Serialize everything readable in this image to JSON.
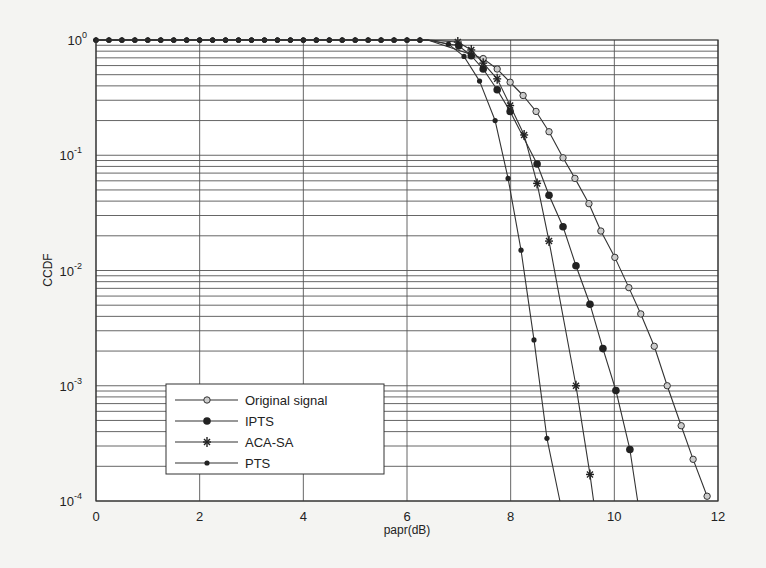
{
  "chart_data": {
    "type": "line",
    "title": "",
    "xlabel": "papr(dB)",
    "ylabel": "CCDF",
    "xlim": [
      0,
      12
    ],
    "ylim": [
      0.0001,
      1
    ],
    "yscale": "log",
    "grid": true,
    "x_ticks": [
      "0",
      "2",
      "4",
      "6",
      "8",
      "10",
      "12"
    ],
    "y_ticks": [
      {
        "base": "10",
        "exp": "0"
      },
      {
        "base": "10",
        "exp": "-1"
      },
      {
        "base": "10",
        "exp": "-2"
      },
      {
        "base": "10",
        "exp": "-3"
      },
      {
        "base": "10",
        "exp": "-4"
      }
    ],
    "legend_position": "lower left",
    "series": [
      {
        "name": "Original signal",
        "marker": "open-circle",
        "points": [
          [
            0,
            1
          ],
          [
            6.4,
            1
          ],
          [
            7.47,
            0.69
          ],
          [
            7.74,
            0.56
          ],
          [
            7.99,
            0.43
          ],
          [
            8.24,
            0.33
          ],
          [
            8.49,
            0.24
          ],
          [
            8.74,
            0.16
          ],
          [
            9.01,
            0.095
          ],
          [
            9.24,
            0.063
          ],
          [
            9.51,
            0.038
          ],
          [
            9.74,
            0.022
          ],
          [
            10.01,
            0.013
          ],
          [
            10.28,
            0.0071
          ],
          [
            10.51,
            0.0042
          ],
          [
            10.77,
            0.0022
          ],
          [
            11.02,
            0.001
          ],
          [
            11.29,
            0.00045
          ],
          [
            11.52,
            0.00023
          ],
          [
            11.79,
            0.00011
          ]
        ]
      },
      {
        "name": "IPTS",
        "marker": "filled-circle",
        "points": [
          [
            0,
            1
          ],
          [
            6.4,
            1
          ],
          [
            7.0,
            0.89
          ],
          [
            7.24,
            0.73
          ],
          [
            7.47,
            0.56
          ],
          [
            7.74,
            0.37
          ],
          [
            7.99,
            0.24
          ],
          [
            8.51,
            0.084
          ],
          [
            8.74,
            0.045
          ],
          [
            9.01,
            0.024
          ],
          [
            9.26,
            0.011
          ],
          [
            9.53,
            0.0051
          ],
          [
            9.78,
            0.0021
          ],
          [
            10.03,
            0.00091
          ],
          [
            10.3,
            0.00028
          ],
          [
            10.45,
            0.0001
          ]
        ]
      },
      {
        "name": "ACA-SA",
        "marker": "star",
        "points": [
          [
            0,
            1
          ],
          [
            6.4,
            1
          ],
          [
            6.98,
            0.96
          ],
          [
            7.24,
            0.82
          ],
          [
            7.47,
            0.63
          ],
          [
            7.74,
            0.46
          ],
          [
            7.99,
            0.27
          ],
          [
            8.26,
            0.15
          ],
          [
            8.51,
            0.057
          ],
          [
            8.74,
            0.018
          ],
          [
            9.26,
            0.001
          ],
          [
            9.53,
            0.00017
          ],
          [
            9.6,
            0.0001
          ]
        ]
      },
      {
        "name": "PTS",
        "marker": "dot",
        "points": [
          [
            0,
            1
          ],
          [
            6.4,
            1
          ],
          [
            6.8,
            0.92
          ],
          [
            7.1,
            0.72
          ],
          [
            7.4,
            0.44
          ],
          [
            7.7,
            0.2
          ],
          [
            7.95,
            0.063
          ],
          [
            8.2,
            0.015
          ],
          [
            8.45,
            0.0025
          ],
          [
            8.7,
            0.00035
          ],
          [
            8.95,
            0.0001
          ]
        ]
      }
    ]
  }
}
